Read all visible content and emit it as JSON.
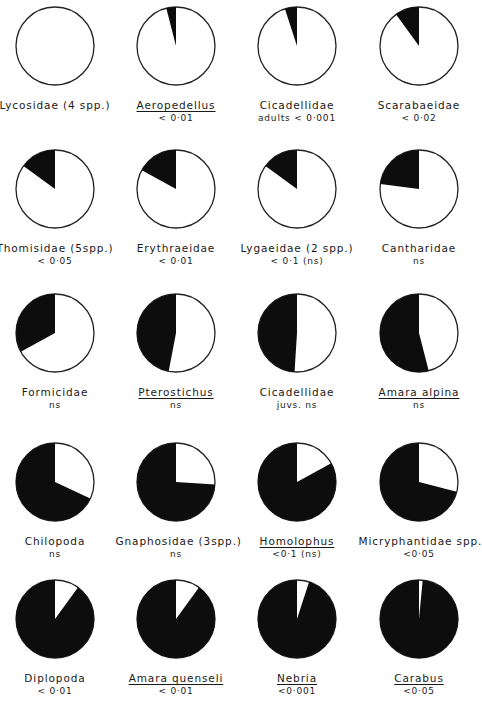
{
  "chart_data": {
    "type": "pie",
    "colors": {
      "filled": "#0d0d0d",
      "empty": "#ffffff",
      "outline": "#222222"
    },
    "charts": [
      {
        "name": "Lycosidae (4 spp.)",
        "italic_name": false,
        "significance": "",
        "black_fraction": 0.0
      },
      {
        "name": "Aeropedellus",
        "italic_name": true,
        "significance": "< 0·01",
        "black_fraction": 0.04
      },
      {
        "name": "Cicadellidae",
        "italic_name": false,
        "significance": "adults < 0·001",
        "black_fraction": 0.05
      },
      {
        "name": "Scarabaeidae",
        "italic_name": false,
        "significance": "< 0·02",
        "black_fraction": 0.1
      },
      {
        "name": "Thomisidae (5spp.)",
        "italic_name": false,
        "significance": "< 0·05",
        "black_fraction": 0.15
      },
      {
        "name": "Erythraeidae",
        "italic_name": false,
        "significance": "< 0·01",
        "black_fraction": 0.17
      },
      {
        "name": "Lygaeidae (2 spp.)",
        "italic_name": false,
        "significance": "< 0·1 (ns)",
        "black_fraction": 0.15
      },
      {
        "name": "Cantharidae",
        "italic_name": false,
        "significance": "ns",
        "black_fraction": 0.23
      },
      {
        "name": "Formicidae",
        "italic_name": false,
        "significance": "ns",
        "black_fraction": 0.33
      },
      {
        "name": "Pterostichus",
        "italic_name": true,
        "significance": "ns",
        "black_fraction": 0.47
      },
      {
        "name": "Cicadellidae",
        "italic_name": false,
        "significance": "juvs. ns",
        "black_fraction": 0.49
      },
      {
        "name": "Amara alpina",
        "italic_name": true,
        "significance": "ns",
        "black_fraction": 0.54
      },
      {
        "name": "Chilopoda",
        "italic_name": false,
        "significance": "ns",
        "black_fraction": 0.68
      },
      {
        "name": "Gnaphosidae (3spp.)",
        "italic_name": false,
        "significance": "ns",
        "black_fraction": 0.74
      },
      {
        "name": "Homolophus",
        "italic_name": true,
        "significance": "<0·1 (ns)",
        "black_fraction": 0.83
      },
      {
        "name": "Micryphantidae spp.",
        "italic_name": false,
        "significance": "<0·05",
        "black_fraction": 0.71
      },
      {
        "name": "Diplopoda",
        "italic_name": false,
        "significance": "< 0·01",
        "black_fraction": 0.9
      },
      {
        "name": "Amara quenseli",
        "italic_name": true,
        "significance": "< 0·01",
        "black_fraction": 0.9
      },
      {
        "name": "Nebria",
        "italic_name": true,
        "significance": "<0·001",
        "black_fraction": 0.95
      },
      {
        "name": "Carabus",
        "italic_name": true,
        "significance": "<0·05",
        "black_fraction": 0.985
      }
    ],
    "layout": {
      "rows": 5,
      "cols": 4,
      "radius": 39,
      "col_centers_x": [
        55,
        176,
        297,
        419
      ],
      "row_centers_y": [
        46,
        189,
        333,
        482,
        619
      ]
    }
  }
}
